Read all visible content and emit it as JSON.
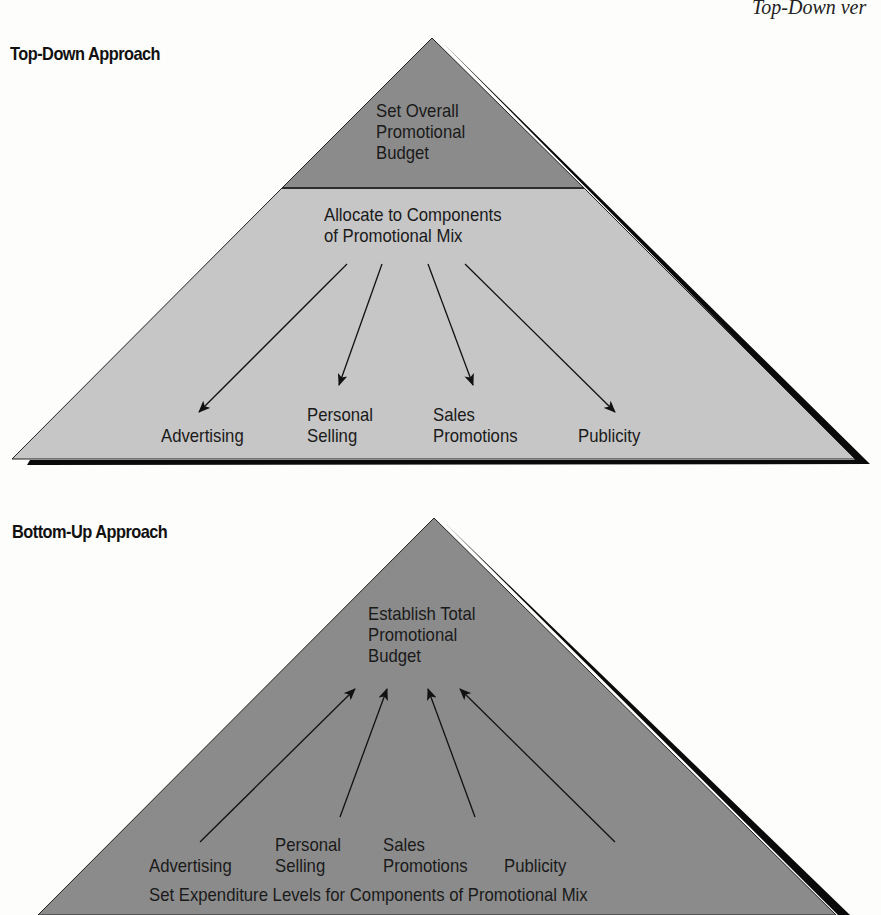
{
  "running_head": "Top-Down ver",
  "top_down": {
    "heading": "Top-Down Approach",
    "apex_box": {
      "lines": [
        "Set Overall",
        "Promotional",
        "Budget"
      ]
    },
    "allocate_box": {
      "lines": [
        "Allocate to Components",
        "of Promotional Mix"
      ]
    },
    "components": [
      {
        "lines": [
          "Advertising"
        ]
      },
      {
        "lines": [
          "Personal",
          "Selling"
        ]
      },
      {
        "lines": [
          "Sales",
          "Promotions"
        ]
      },
      {
        "lines": [
          "Publicity"
        ]
      }
    ],
    "arrow_direction": "down"
  },
  "bottom_up": {
    "heading": "Bottom-Up Approach",
    "apex_box": {
      "lines": [
        "Establish Total",
        "Promotional",
        "Budget"
      ]
    },
    "components": [
      {
        "lines": [
          "Advertising"
        ]
      },
      {
        "lines": [
          "Personal",
          "Selling"
        ]
      },
      {
        "lines": [
          "Sales",
          "Promotions"
        ]
      },
      {
        "lines": [
          "Publicity"
        ]
      }
    ],
    "base_label": "Set Expenditure Levels for Components of Promotional Mix",
    "arrow_direction": "up"
  },
  "colors": {
    "dark_fill": "#8b8b8b",
    "light_fill": "#c6c6c6",
    "shadow": "#0a0a0a",
    "outline": "#222222",
    "text": "#1a1a1a"
  }
}
